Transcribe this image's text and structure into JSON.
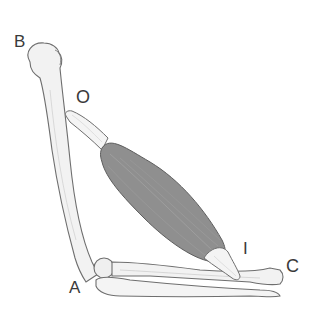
{
  "figure": {
    "labels": {
      "B": "B",
      "O": "O",
      "I": "I",
      "C": "C",
      "A": "A"
    },
    "colors": {
      "background": "#ffffff",
      "bone_fill": "#f2f2f2",
      "bone_outline": "#6e6e6e",
      "muscle_fill": "#8f8f8f",
      "muscle_outline": "#5e5e5e",
      "tendon_fill": "#f4f4f4",
      "label_text": "#3a3a3a"
    }
  }
}
